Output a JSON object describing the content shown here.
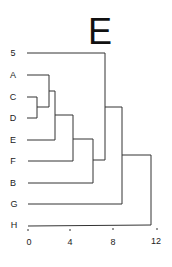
{
  "title": "E",
  "diagram": {
    "type": "dendrogram",
    "leaves": [
      "5",
      "A",
      "C",
      "D",
      "E",
      "F",
      "B",
      "G",
      "H"
    ],
    "merges": [
      {
        "join": [
          "C",
          "D"
        ],
        "height": 0.8
      },
      {
        "join": [
          "A",
          "(C,D)"
        ],
        "height": 2.0
      },
      {
        "join": [
          "(A,C,D)",
          "E"
        ],
        "height": 2.6
      },
      {
        "join": [
          "(A,C,D,E)",
          "F"
        ],
        "height": 4.3
      },
      {
        "join": [
          "(A,C,D,E,F)",
          "B"
        ],
        "height": 6.2
      },
      {
        "join": [
          "5",
          "(A,B,C,D,E,F)"
        ],
        "height": 7.4
      },
      {
        "join": [
          "(5,A,B,C,D,E,F)",
          "G"
        ],
        "height": 9.0
      },
      {
        "join": [
          "(5,A,B,C,D,E,F,G)",
          "H"
        ],
        "height": 11.6
      }
    ],
    "axis": {
      "ticks": [
        "0",
        "4",
        "8",
        "12"
      ],
      "range": [
        0,
        12
      ]
    }
  },
  "colors": {
    "line": "#333333",
    "text": "#222222",
    "background": "#ffffff"
  }
}
